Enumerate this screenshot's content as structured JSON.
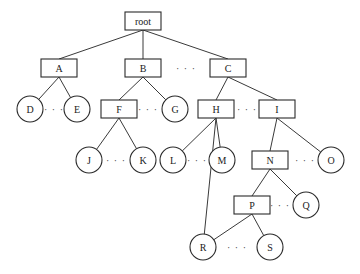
{
  "diagram": {
    "type": "tree",
    "nodes": [
      {
        "id": "root",
        "label": "root",
        "shape": "rect",
        "x": 143,
        "y": 21
      },
      {
        "id": "A",
        "label": "A",
        "shape": "rect",
        "x": 59,
        "y": 68
      },
      {
        "id": "B",
        "label": "B",
        "shape": "rect",
        "x": 143,
        "y": 68
      },
      {
        "id": "C",
        "label": "C",
        "shape": "rect",
        "x": 228,
        "y": 68
      },
      {
        "id": "D",
        "label": "D",
        "shape": "circle",
        "x": 30,
        "y": 109
      },
      {
        "id": "E",
        "label": "E",
        "shape": "circle",
        "x": 77,
        "y": 109
      },
      {
        "id": "F",
        "label": "F",
        "shape": "rect",
        "x": 119,
        "y": 109
      },
      {
        "id": "G",
        "label": "G",
        "shape": "circle",
        "x": 175,
        "y": 109
      },
      {
        "id": "H",
        "label": "H",
        "shape": "rect",
        "x": 216,
        "y": 109
      },
      {
        "id": "I",
        "label": "I",
        "shape": "rect",
        "x": 277,
        "y": 109
      },
      {
        "id": "J",
        "label": "J",
        "shape": "circle",
        "x": 89,
        "y": 160
      },
      {
        "id": "K",
        "label": "K",
        "shape": "circle",
        "x": 143,
        "y": 160
      },
      {
        "id": "L",
        "label": "L",
        "shape": "circle",
        "x": 173,
        "y": 160
      },
      {
        "id": "M",
        "label": "M",
        "shape": "circle",
        "x": 222,
        "y": 160
      },
      {
        "id": "N",
        "label": "N",
        "shape": "rect",
        "x": 270,
        "y": 160
      },
      {
        "id": "O",
        "label": "O",
        "shape": "circle",
        "x": 331,
        "y": 160
      },
      {
        "id": "P",
        "label": "P",
        "shape": "rect",
        "x": 252,
        "y": 205
      },
      {
        "id": "Q",
        "label": "Q",
        "shape": "circle",
        "x": 306,
        "y": 205
      },
      {
        "id": "R",
        "label": "R",
        "shape": "circle",
        "x": 203,
        "y": 247
      },
      {
        "id": "S",
        "label": "S",
        "shape": "circle",
        "x": 270,
        "y": 247
      }
    ],
    "edges": [
      [
        "root",
        "A"
      ],
      [
        "root",
        "B"
      ],
      [
        "root",
        "C"
      ],
      [
        "A",
        "D"
      ],
      [
        "A",
        "E"
      ],
      [
        "B",
        "F"
      ],
      [
        "B",
        "G"
      ],
      [
        "C",
        "H"
      ],
      [
        "C",
        "I"
      ],
      [
        "F",
        "J"
      ],
      [
        "F",
        "K"
      ],
      [
        "H",
        "L"
      ],
      [
        "H",
        "M"
      ],
      [
        "H",
        "R"
      ],
      [
        "I",
        "N"
      ],
      [
        "I",
        "O"
      ],
      [
        "N",
        "P"
      ],
      [
        "N",
        "Q"
      ],
      [
        "P",
        "R"
      ],
      [
        "P",
        "S"
      ]
    ],
    "ellipses": [
      {
        "label": "· · ·",
        "x": 186,
        "y": 68
      },
      {
        "label": "· · ·",
        "x": 54,
        "y": 109
      },
      {
        "label": "· · ·",
        "x": 148,
        "y": 109
      },
      {
        "label": "· · ·",
        "x": 247,
        "y": 109
      },
      {
        "label": "· · ·",
        "x": 116,
        "y": 160
      },
      {
        "label": "· · ·",
        "x": 197,
        "y": 160
      },
      {
        "label": "· · ·",
        "x": 305,
        "y": 160
      },
      {
        "label": "· · ·",
        "x": 280,
        "y": 205
      },
      {
        "label": "· · ·",
        "x": 237,
        "y": 247
      }
    ]
  }
}
